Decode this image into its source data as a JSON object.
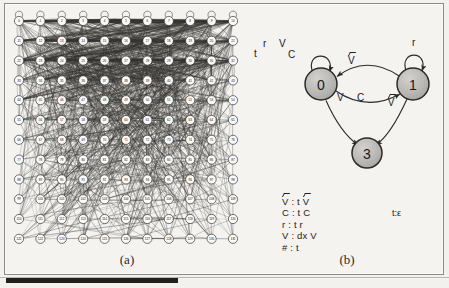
{
  "figure": {
    "captions": {
      "a": "(a)",
      "b": "(b)"
    }
  },
  "panel_a": {
    "name": "dense-node-graph",
    "grid": {
      "columns": 11,
      "rows": 12,
      "node_count": 132
    },
    "node_labels": [
      "0",
      "1",
      "2",
      "3",
      "4",
      "5",
      "6",
      "7",
      "8",
      "9",
      "10",
      "11",
      "12",
      "13",
      "14",
      "15",
      "16",
      "17",
      "18",
      "19",
      "20",
      "21",
      "22",
      "23",
      "24",
      "25",
      "26",
      "27",
      "28",
      "29",
      "30",
      "31",
      "32",
      "33",
      "34",
      "35",
      "36",
      "37",
      "38",
      "39",
      "40",
      "41",
      "42",
      "43",
      "44",
      "45",
      "46",
      "47",
      "48",
      "49",
      "50",
      "51",
      "52",
      "53",
      "54",
      "55",
      "56",
      "57",
      "58",
      "59",
      "60",
      "61",
      "62",
      "63",
      "64",
      "65",
      "66",
      "67",
      "68",
      "69",
      "70",
      "71",
      "72",
      "73",
      "74",
      "75",
      "76",
      "77",
      "78",
      "79",
      "80",
      "81",
      "82",
      "83",
      "84",
      "85",
      "86",
      "87",
      "88",
      "89",
      "90",
      "91",
      "92",
      "93",
      "94",
      "95",
      "96",
      "97",
      "98",
      "99",
      "100",
      "101",
      "102",
      "103",
      "104",
      "105",
      "106",
      "107",
      "108",
      "109",
      "110",
      "111",
      "112",
      "113",
      "114",
      "115",
      "116",
      "117",
      "118",
      "119",
      "120",
      "121",
      "122",
      "123",
      "124",
      "125",
      "126",
      "127",
      "128",
      "129",
      "130",
      "131"
    ]
  },
  "panel_b": {
    "name": "automaton-diagram",
    "states": [
      {
        "id": "s0",
        "label": "0",
        "cx": 71,
        "cy": 79
      },
      {
        "id": "s1",
        "label": "1",
        "cx": 163,
        "cy": 79
      },
      {
        "id": "s3",
        "label": "3",
        "cx": 117,
        "cy": 148
      }
    ],
    "self_loop_labels": {
      "state0": [
        "t",
        "r",
        "V",
        "C"
      ],
      "state1": [
        "r"
      ]
    },
    "edge_labels": {
      "one_to_zero_top": "V̂",
      "one_to_zero_bottom": [
        "V",
        "C",
        "V̂"
      ],
      "one_to_three": "t:ε"
    },
    "legend": [
      "V̂ : t V̂",
      "C : t C",
      "r : t r",
      "V : dx V",
      "# : t"
    ]
  },
  "colors": {
    "state_fill": "#b6b5b2",
    "state_stroke": "#2c2a27",
    "page_bg": "#f4f3f0",
    "frame_border": "#8d8b86",
    "edge_stroke": "#3a3835"
  }
}
